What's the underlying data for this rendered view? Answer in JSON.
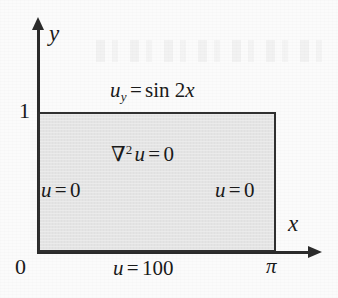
{
  "figure": {
    "kind": "boundary-value-problem-diagram"
  },
  "axes": {
    "x_label": "x",
    "y_label": "y",
    "origin_label": "0",
    "y_tick_label": "1",
    "x_tick_label": "π"
  },
  "domain": {
    "x_range": [
      "0",
      "π"
    ],
    "y_range": [
      "0",
      "1"
    ],
    "fill_color": "#e4e4e4",
    "border_color": "#2f2f2f"
  },
  "equations": {
    "pde_operator": "∇2",
    "pde_nabla": "∇",
    "pde_exponent": "2",
    "pde_var": "u",
    "pde_eq": "=",
    "pde_value": "0",
    "interior": "∇²u = 0"
  },
  "boundary_conditions": {
    "top": {
      "var": "u",
      "subscript": "y",
      "eq": "=",
      "rhs_func": "sin",
      "rhs_arg_coeff": "2",
      "rhs_arg_var": "x",
      "full": "u_y = sin 2x",
      "edge": "y = 1"
    },
    "bottom": {
      "var": "u",
      "eq": "=",
      "value": "100",
      "full": "u = 100",
      "edge": "y = 0"
    },
    "left": {
      "var": "u",
      "eq": "=",
      "value": "0",
      "full": "u = 0",
      "edge": "x = 0"
    },
    "right": {
      "var": "u",
      "eq": "=",
      "value": "0",
      "full": "u = 0",
      "edge": "x = π"
    }
  },
  "colors": {
    "page_background": "#fbfbfb",
    "ink": "#2b2b2b",
    "region_fill": "#e4e4e4"
  }
}
